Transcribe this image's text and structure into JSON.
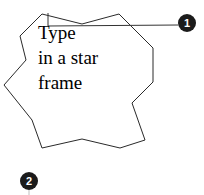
{
  "canvas": {
    "width": 204,
    "height": 195,
    "background_color": "#ffffff"
  },
  "star_frame": {
    "shape": "six-pointed-star",
    "stroke_color": "#2a2a2a",
    "fill_color": "#ffffff",
    "stroke_width": 1,
    "points": "42,14 82,24 119,14 153,48 153,82 132,103 145,140 120,148 82,139 42,148 32,120 4,85 26,60 20,36",
    "outer_points": [
      {
        "x": 42,
        "y": 14
      },
      {
        "x": 119,
        "y": 14
      },
      {
        "x": 153,
        "y": 82
      },
      {
        "x": 120,
        "y": 148
      },
      {
        "x": 42,
        "y": 148
      },
      {
        "x": 4,
        "y": 85
      }
    ],
    "inner_points": [
      {
        "x": 82,
        "y": 26
      },
      {
        "x": 140,
        "y": 46
      },
      {
        "x": 139,
        "y": 117
      },
      {
        "x": 82,
        "y": 139
      },
      {
        "x": 25,
        "y": 118
      },
      {
        "x": 23,
        "y": 45
      }
    ]
  },
  "star_text": {
    "lines": [
      "Type",
      "in a star",
      "frame"
    ],
    "color": "#000000",
    "font_size_px": 19,
    "align": "left"
  },
  "callouts": [
    {
      "number": "1",
      "circle_color": "#1b1b1b",
      "text_color": "#ffffff",
      "center": {
        "x": 187,
        "y": 23
      },
      "radius": 9,
      "leader_line": {
        "from": {
          "x": 48,
          "y": 26
        },
        "to": {
          "x": 178,
          "y": 25
        },
        "tick": {
          "x": 48,
          "y_top": 13,
          "y_bottom": 26
        },
        "color": "#333333"
      }
    },
    {
      "number": "2",
      "circle_color": "#1b1b1b",
      "text_color": "#ffffff",
      "center": {
        "x": 29,
        "y": 181
      },
      "radius": 9,
      "leader_line": {
        "from": {
          "x": 29,
          "y": 190
        },
        "to": {
          "x": 29,
          "y": 195
        },
        "color": "#bfbfbf"
      }
    }
  ]
}
